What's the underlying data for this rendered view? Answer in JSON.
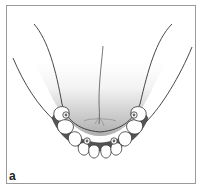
{
  "figure": {
    "panel_label": "a",
    "colors": {
      "frame": "#9a9a9a",
      "outline": "#333333",
      "tongue_gradient_top": "#ffffff",
      "tongue_gradient_bottom": "#a8a8a8",
      "bar": "#555555",
      "tooth": "#ffffff",
      "implant": "#6a6a6a"
    },
    "implants": [
      {
        "id": "implant-1",
        "x": 66,
        "y": 115
      },
      {
        "id": "implant-2",
        "x": 87,
        "y": 141
      },
      {
        "id": "implant-3",
        "x": 114,
        "y": 141
      },
      {
        "id": "implant-4",
        "x": 134,
        "y": 115
      }
    ],
    "teeth_count": 10
  }
}
